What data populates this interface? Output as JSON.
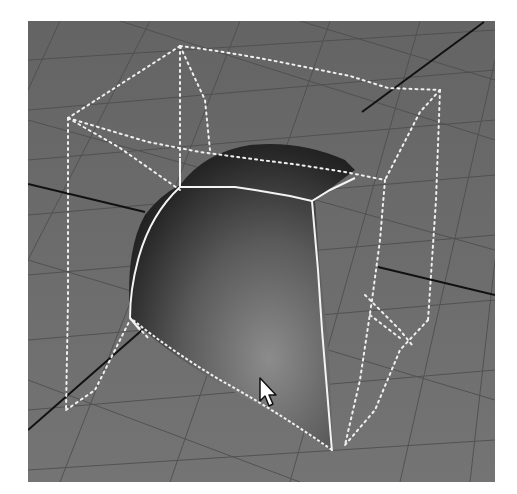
{
  "viewport": {
    "label": "3D perspective viewport",
    "background_color": "#6e6e6e",
    "grid_color": "#4a4a4a",
    "axis_color": "#111111",
    "wire_color": "#ffffff"
  },
  "scene": {
    "object": {
      "name": "quarter-sphere surface",
      "shading_dark": "#141414",
      "shading_light": "#8a8a8a"
    },
    "lattice": {
      "name": "deformation lattice cage",
      "style": "dotted"
    }
  },
  "cursor": {
    "icon": "arrow-cursor-icon",
    "x": 262,
    "y": 377
  }
}
